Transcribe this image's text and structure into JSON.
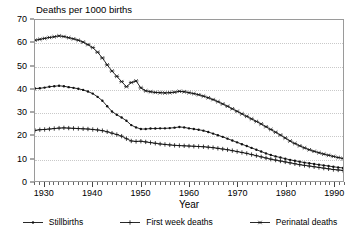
{
  "chart_data": {
    "type": "line",
    "title": "Deaths per 1000 births",
    "xlabel": "Year",
    "ylabel": "Deaths per 1000 births",
    "xlim": [
      1928,
      1992
    ],
    "ylim": [
      0,
      70
    ],
    "ytick_labels": [
      "0",
      "10",
      "20",
      "30",
      "40",
      "50",
      "60",
      "70"
    ],
    "ytick_values": [
      0,
      10,
      20,
      30,
      40,
      50,
      60,
      70
    ],
    "xtick_labels": [
      "1930",
      "1940",
      "1950",
      "1960",
      "1970",
      "1980",
      "1990"
    ],
    "xtick_values": [
      1930,
      1940,
      1950,
      1960,
      1970,
      1980,
      1990
    ],
    "grid": "horizontal-dotted",
    "legend_position": "bottom",
    "x": [
      1928,
      1929,
      1930,
      1931,
      1932,
      1933,
      1934,
      1935,
      1936,
      1937,
      1938,
      1939,
      1940,
      1941,
      1942,
      1943,
      1944,
      1945,
      1946,
      1947,
      1948,
      1949,
      1950,
      1951,
      1952,
      1953,
      1954,
      1955,
      1956,
      1957,
      1958,
      1959,
      1960,
      1961,
      1962,
      1963,
      1964,
      1965,
      1966,
      1967,
      1968,
      1969,
      1970,
      1971,
      1972,
      1973,
      1974,
      1975,
      1976,
      1977,
      1978,
      1979,
      1980,
      1981,
      1982,
      1983,
      1984,
      1985,
      1986,
      1987,
      1988,
      1989,
      1990,
      1991,
      1992
    ],
    "series": [
      {
        "name": "Stillbirths",
        "marker": "dot",
        "values": [
          40.2,
          40.3,
          40.6,
          41.0,
          41.2,
          41.4,
          41.2,
          40.8,
          40.5,
          40.1,
          39.6,
          38.9,
          38.0,
          36.6,
          34.9,
          32.5,
          30.2,
          28.8,
          27.6,
          26.2,
          24.3,
          23.3,
          22.6,
          22.6,
          22.8,
          22.8,
          22.9,
          22.9,
          23.0,
          23.2,
          23.5,
          23.3,
          22.9,
          22.6,
          22.3,
          21.9,
          21.3,
          20.6,
          19.9,
          19.2,
          18.4,
          17.6,
          16.8,
          16.0,
          15.2,
          14.4,
          13.6,
          12.8,
          12.0,
          11.3,
          10.7,
          10.2,
          9.7,
          9.2,
          8.8,
          8.4,
          8.0,
          7.7,
          7.4,
          7.1,
          6.8,
          6.5,
          6.2,
          5.9,
          5.7
        ]
      },
      {
        "name": "First week deaths",
        "marker": "plus",
        "values": [
          22.0,
          22.3,
          22.4,
          22.6,
          22.8,
          23.0,
          23.1,
          23.0,
          22.9,
          22.8,
          22.7,
          22.6,
          22.4,
          22.2,
          21.9,
          21.4,
          20.8,
          20.2,
          19.5,
          18.4,
          17.4,
          17.2,
          17.3,
          17.0,
          16.7,
          16.4,
          16.1,
          15.9,
          15.7,
          15.5,
          15.4,
          15.3,
          15.2,
          15.1,
          15.0,
          14.9,
          14.7,
          14.5,
          14.2,
          13.9,
          13.6,
          13.2,
          12.8,
          12.4,
          12.0,
          11.5,
          11.0,
          10.5,
          10.0,
          9.5,
          9.1,
          8.7,
          8.3,
          7.9,
          7.5,
          7.1,
          6.8,
          6.5,
          6.2,
          5.9,
          5.6,
          5.3,
          5.0,
          4.8,
          4.6
        ]
      },
      {
        "name": "Perinatal deaths",
        "marker": "star",
        "values": [
          61.2,
          61.6,
          62.0,
          62.4,
          62.7,
          63.1,
          62.8,
          62.3,
          61.8,
          61.2,
          60.4,
          59.3,
          58.0,
          56.0,
          53.5,
          50.5,
          47.8,
          45.5,
          43.2,
          41.0,
          42.8,
          43.5,
          40.5,
          39.2,
          38.8,
          38.5,
          38.4,
          38.3,
          38.4,
          38.6,
          39.0,
          38.8,
          38.4,
          38.0,
          37.5,
          36.9,
          36.2,
          35.4,
          34.5,
          33.5,
          32.5,
          31.4,
          30.3,
          29.2,
          28.1,
          27.0,
          25.9,
          24.8,
          23.6,
          22.4,
          21.2,
          20.0,
          18.7,
          17.4,
          16.3,
          15.3,
          14.4,
          13.6,
          12.9,
          12.3,
          11.7,
          11.2,
          10.7,
          10.2,
          9.8
        ]
      }
    ]
  },
  "legend": {
    "entries": [
      {
        "label": "Stillbirths",
        "marker": "dot"
      },
      {
        "label": "First week deaths",
        "marker": "plus"
      },
      {
        "label": "Perinatal deaths",
        "marker": "star"
      }
    ]
  }
}
